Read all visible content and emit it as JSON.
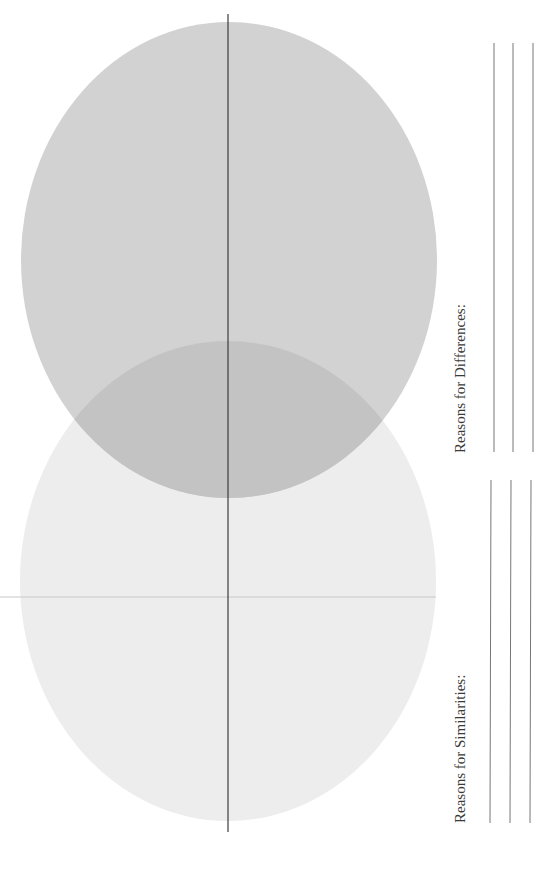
{
  "worksheet": {
    "type": "Venn diagram (rotated)",
    "labels": {
      "differences": "Reasons for Differences:",
      "similarities": "Reasons for Similarities:"
    },
    "answer_lines": {
      "differences_count": 3,
      "similarities_count": 3
    }
  },
  "colors": {
    "top_circle": "#d0d0d0",
    "bottom_circle": "#ececec",
    "overlap": "#c0c0c0",
    "lines": "#555555",
    "text": "#3a3a3a"
  }
}
